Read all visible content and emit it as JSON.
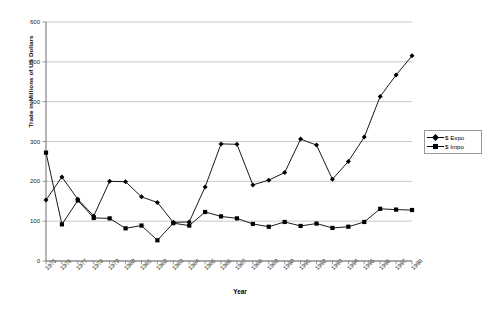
{
  "chart_data": {
    "type": "line",
    "title": "",
    "xlabel": "Year",
    "ylabel": "Trade in Millions of US Dollars",
    "xlim": [
      1975,
      1998
    ],
    "ylim": [
      0,
      600
    ],
    "ytick_values": [
      0,
      100,
      200,
      300,
      400,
      500,
      600
    ],
    "ytick_labels": [
      "0",
      "100",
      "200",
      "300",
      "400",
      "500",
      "600"
    ],
    "grid": "horizontal",
    "legend_position": "right",
    "categories": [
      "1975",
      "1976",
      "1977",
      "1978",
      "1979",
      "1980",
      "1981",
      "1982",
      "1983",
      "1984",
      "1985",
      "1986",
      "1987",
      "1988",
      "1989",
      "1990",
      "1991",
      "1992",
      "1993",
      "1994",
      "1995",
      "1996",
      "1997",
      "1998"
    ],
    "series": [
      {
        "name": "$ Exports",
        "marker": "diamond",
        "color": "#000000",
        "values": [
          153,
          211,
          155,
          113,
          200,
          199,
          161,
          147,
          97,
          98,
          186,
          294,
          293,
          191,
          203,
          222,
          306,
          291,
          205,
          250,
          311,
          413,
          467,
          515
        ]
      },
      {
        "name": "$ Imports",
        "marker": "square",
        "color": "#000000",
        "values": [
          272,
          92,
          152,
          108,
          107,
          82,
          89,
          52,
          95,
          89,
          123,
          112,
          107,
          93,
          86,
          98,
          88,
          94,
          83,
          86,
          98,
          131,
          129,
          128
        ]
      }
    ]
  },
  "legend": {
    "entries": [
      {
        "label": "$ Expo"
      },
      {
        "label": "$ Impo"
      }
    ]
  },
  "axes": {
    "y_title": "Trade in Millions of US Dollars",
    "x_title": "Year"
  }
}
